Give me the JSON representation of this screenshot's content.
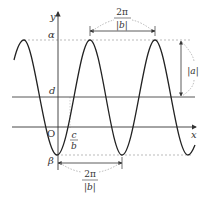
{
  "diagram": {
    "type": "sinusoid-graph",
    "function_form": "y = a·sin(bx − c) + d",
    "axes": {
      "x_label": "x",
      "y_label": "y",
      "origin_label": "O"
    },
    "levels": {
      "max_label": "α",
      "midline_label": "d",
      "min_label": "β"
    },
    "annotations": {
      "period_top": {
        "numerator": "2π",
        "denominator": "|b|"
      },
      "period_bottom": {
        "numerator": "2π",
        "denominator": "|b|"
      },
      "amplitude": "|a|",
      "phase_shift": {
        "numerator": "c",
        "denominator": "b"
      }
    },
    "colors": {
      "curve": "#222222",
      "axis": "#333333",
      "guide": "#999999"
    }
  }
}
